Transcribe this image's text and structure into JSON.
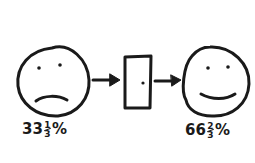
{
  "diagram": {
    "left_face": {
      "expression": "sad",
      "label_whole": "33",
      "label_num": "1",
      "label_den": "3",
      "label_suffix": "%"
    },
    "middle": {
      "object": "door"
    },
    "right_face": {
      "expression": "happy",
      "label_whole": "66",
      "label_num": "2",
      "label_den": "3",
      "label_suffix": "%"
    },
    "stroke_color": "#1a1a1a"
  }
}
